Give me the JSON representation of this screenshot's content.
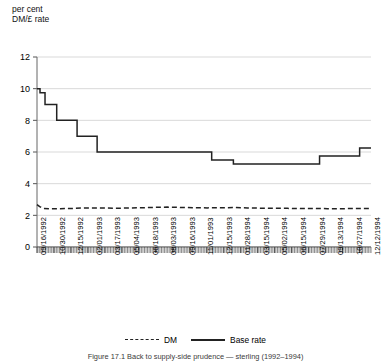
{
  "figure": {
    "ylabel_line1": "per cent",
    "ylabel_line2": "DM/£ rate",
    "caption": "Figure 17.1  Back to supply-side prudence — sterling (1992–1994)"
  },
  "legend": {
    "items": [
      {
        "label": "DM",
        "style": "dashed",
        "color": "#222222"
      },
      {
        "label": "Base rate",
        "style": "solid",
        "color": "#222222"
      }
    ]
  },
  "chart_data": {
    "type": "line",
    "title": "",
    "subtitle": "",
    "xlabel": "",
    "ylabel": "per cent / DM/£ rate",
    "ylim": [
      0,
      12
    ],
    "yticks": [
      0,
      2,
      4,
      6,
      8,
      10,
      12
    ],
    "grid": true,
    "grid_axis": "y",
    "legend_position": "bottom",
    "x_tick_labels": [
      "09/16/1992",
      "10/30/1992",
      "12/15/1992",
      "02/01/1993",
      "03/17/1993",
      "05/04/1993",
      "06/18/1993",
      "08/03/1993",
      "09/16/1993",
      "11/01/1993",
      "12/15/1993",
      "01/28/1994",
      "03/15/1994",
      "05/02/1994",
      "06/15/1994",
      "07/29/1994",
      "09/13/1994",
      "10/27/1994",
      "12/12/1994"
    ],
    "x_range_start": "09/16/1992",
    "x_range_end": "12/12/1994",
    "series": [
      {
        "name": "Base rate",
        "style": "solid",
        "color": "#222222",
        "step": true,
        "points": [
          {
            "t": 0.0,
            "v": 10.0
          },
          {
            "t": 0.007,
            "v": 10.0
          },
          {
            "t": 0.009,
            "v": 9.75
          },
          {
            "t": 0.022,
            "v": 9.75
          },
          {
            "t": 0.024,
            "v": 9.0
          },
          {
            "t": 0.057,
            "v": 9.0
          },
          {
            "t": 0.059,
            "v": 8.0
          },
          {
            "t": 0.118,
            "v": 8.0
          },
          {
            "t": 0.12,
            "v": 7.0
          },
          {
            "t": 0.178,
            "v": 7.0
          },
          {
            "t": 0.18,
            "v": 6.0
          },
          {
            "t": 0.52,
            "v": 6.0
          },
          {
            "t": 0.523,
            "v": 5.5
          },
          {
            "t": 0.585,
            "v": 5.5
          },
          {
            "t": 0.588,
            "v": 5.25
          },
          {
            "t": 0.843,
            "v": 5.25
          },
          {
            "t": 0.846,
            "v": 5.75
          },
          {
            "t": 0.963,
            "v": 5.75
          },
          {
            "t": 0.966,
            "v": 6.25
          },
          {
            "t": 1.0,
            "v": 6.25
          }
        ]
      },
      {
        "name": "DM",
        "style": "dashed",
        "color": "#222222",
        "step": false,
        "points": [
          {
            "t": 0.0,
            "v": 2.68
          },
          {
            "t": 0.008,
            "v": 2.55
          },
          {
            "t": 0.02,
            "v": 2.44
          },
          {
            "t": 0.04,
            "v": 2.41
          },
          {
            "t": 0.07,
            "v": 2.42
          },
          {
            "t": 0.11,
            "v": 2.44
          },
          {
            "t": 0.15,
            "v": 2.47
          },
          {
            "t": 0.19,
            "v": 2.47
          },
          {
            "t": 0.23,
            "v": 2.45
          },
          {
            "t": 0.27,
            "v": 2.46
          },
          {
            "t": 0.31,
            "v": 2.48
          },
          {
            "t": 0.35,
            "v": 2.5
          },
          {
            "t": 0.39,
            "v": 2.52
          },
          {
            "t": 0.43,
            "v": 2.5
          },
          {
            "t": 0.47,
            "v": 2.48
          },
          {
            "t": 0.51,
            "v": 2.47
          },
          {
            "t": 0.55,
            "v": 2.48
          },
          {
            "t": 0.59,
            "v": 2.49
          },
          {
            "t": 0.63,
            "v": 2.47
          },
          {
            "t": 0.67,
            "v": 2.45
          },
          {
            "t": 0.71,
            "v": 2.44
          },
          {
            "t": 0.75,
            "v": 2.44
          },
          {
            "t": 0.79,
            "v": 2.43
          },
          {
            "t": 0.83,
            "v": 2.44
          },
          {
            "t": 0.87,
            "v": 2.42
          },
          {
            "t": 0.91,
            "v": 2.42
          },
          {
            "t": 0.95,
            "v": 2.43
          },
          {
            "t": 1.0,
            "v": 2.43
          }
        ]
      }
    ]
  }
}
